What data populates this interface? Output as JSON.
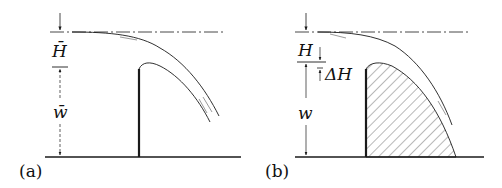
{
  "diagram": {
    "colors": {
      "ink": "#1a1a1a",
      "background": "#ffffff"
    },
    "panels": [
      {
        "id": "a",
        "caption": "(a)",
        "labels": {
          "head": "H̄",
          "height": "w̄"
        }
      },
      {
        "id": "b",
        "caption": "(b)",
        "labels": {
          "head": "H",
          "delta_head": "ΔH",
          "height": "w"
        }
      }
    ]
  }
}
